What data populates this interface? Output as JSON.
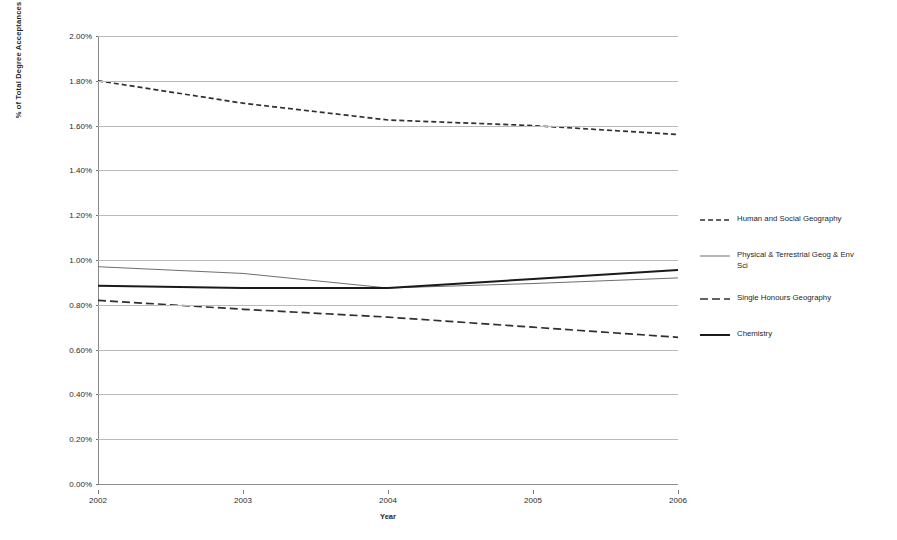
{
  "chart_data": {
    "type": "line",
    "title": "",
    "xlabel": "Year",
    "ylabel": "% of Total Degree Acceptances",
    "x": [
      2002,
      2003,
      2004,
      2005,
      2006
    ],
    "categories": [
      "2002",
      "2003",
      "2004",
      "2005",
      "2006"
    ],
    "xtick_labels": [
      "2002",
      "2003",
      "2004",
      "2005",
      "2006"
    ],
    "ytick_labels": [
      "0.00%",
      "0.20%",
      "0.40%",
      "0.60%",
      "0.80%",
      "1.00%",
      "1.20%",
      "1.40%",
      "1.60%",
      "1.80%",
      "2.00%"
    ],
    "ytick_values": [
      0.0,
      0.2,
      0.4,
      0.6,
      0.8,
      1.0,
      1.2,
      1.4,
      1.6,
      1.8,
      2.0
    ],
    "ylim": [
      0.0,
      2.0
    ],
    "xlim": [
      2002,
      2006
    ],
    "grid": true,
    "legend_position": "right",
    "series": [
      {
        "name": "Human and Social Geography",
        "values": [
          1.8,
          1.7,
          1.625,
          1.6,
          1.56
        ],
        "style": "dashed-fine",
        "color": "#2f2f2f",
        "width": 1.7
      },
      {
        "name": "Physical & Terrestrial Geog & Env Sci",
        "values": [
          0.97,
          0.94,
          0.875,
          0.895,
          0.92
        ],
        "style": "solid-thin",
        "color": "#6e6e6e",
        "width": 1.0
      },
      {
        "name": "Single Honours  Geography",
        "values": [
          0.82,
          0.78,
          0.745,
          0.7,
          0.655
        ],
        "style": "dashed-long",
        "color": "#2f2f2f",
        "width": 1.7
      },
      {
        "name": "Chemistry",
        "values": [
          0.885,
          0.875,
          0.875,
          0.915,
          0.955
        ],
        "style": "solid-thick",
        "color": "#1a1a1a",
        "width": 2.0
      }
    ],
    "legend": [
      {
        "label": "Human and Social Geography",
        "style": "dashed-fine",
        "color": "#2f2f2f",
        "width": 1.7
      },
      {
        "label": "Physical & Terrestrial Geog & Env Sci",
        "style": "solid-thin",
        "color": "#6e6e6e",
        "width": 1.0
      },
      {
        "label": "Single Honours  Geography",
        "style": "dashed-long",
        "color": "#2f2f2f",
        "width": 1.7
      },
      {
        "label": "Chemistry",
        "style": "solid-thick",
        "color": "#1a1a1a",
        "width": 2.0
      }
    ],
    "colors": {
      "gridline": "#b9b9b9",
      "axis": "#8a8a8a",
      "text": "#2a2a2a",
      "background": "#ffffff"
    }
  }
}
